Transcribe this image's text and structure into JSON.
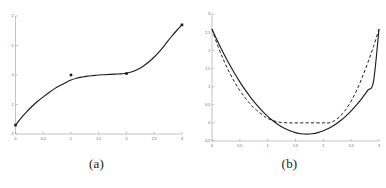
{
  "figure": {
    "background_color": "#ffffff",
    "curve_color": "#1c1c1c",
    "axis_color": "#9b9ca0",
    "tick_label_color": "#55565a"
  },
  "panels": [
    {
      "caption": "(a)",
      "chart_data": {
        "type": "line",
        "title": "",
        "xlabel": "",
        "ylabel": "",
        "xlim": [
          0,
          3
        ],
        "ylim": [
          -2,
          2
        ],
        "grid": false,
        "legend": "none",
        "xticks": [
          0,
          0.5,
          1,
          1.5,
          2,
          2.5,
          3
        ],
        "xtick_labels": [
          "0",
          "0.5",
          "1",
          "1.5",
          "2",
          "2.5",
          "3"
        ],
        "yticks": [
          -2,
          -1,
          0,
          1,
          2
        ],
        "ytick_labels": [
          "-2",
          "-1",
          "0",
          "1",
          "2"
        ],
        "series": [
          {
            "name": "cubic-curve",
            "style": "solid",
            "marker": "square",
            "marker_x": [
              0,
              1,
              2,
              3
            ],
            "marker_y": [
              -1.7,
              0.0,
              0.05,
              1.7
            ],
            "x": [
              0,
              0.1,
              0.2,
              0.3,
              0.4,
              0.5,
              0.6,
              0.7,
              0.8,
              0.9,
              1.0,
              1.1,
              1.2,
              1.3,
              1.4,
              1.5,
              1.6,
              1.7,
              1.8,
              1.9,
              2.0,
              2.1,
              2.2,
              2.3,
              2.4,
              2.5,
              2.6,
              2.7,
              2.8,
              2.9,
              3.0
            ],
            "y": [
              -1.7,
              -1.46,
              -1.25,
              -1.06,
              -0.89,
              -0.74,
              -0.6,
              -0.47,
              -0.36,
              -0.26,
              -0.17,
              -0.11,
              -0.07,
              -0.04,
              -0.02,
              0.0,
              0.01,
              0.02,
              0.03,
              0.04,
              0.06,
              0.11,
              0.19,
              0.3,
              0.44,
              0.61,
              0.81,
              1.04,
              1.28,
              1.5,
              1.7
            ]
          }
        ]
      }
    },
    {
      "caption": "(b)",
      "chart_data": {
        "type": "line",
        "title": "",
        "xlabel": "",
        "ylabel": "",
        "xlim": [
          0,
          3
        ],
        "ylim": [
          -0.5,
          3
        ],
        "grid": false,
        "legend": "none",
        "xticks": [
          0,
          0.5,
          1,
          1.5,
          2,
          2.5,
          3
        ],
        "xtick_labels": [
          "0",
          "0.5",
          "1",
          "1.5",
          "2",
          "2.5",
          "3"
        ],
        "yticks": [
          -0.5,
          0,
          0.5,
          1,
          1.5,
          2,
          2.5,
          3
        ],
        "ytick_labels": [
          "-0.5",
          "0",
          "0.5",
          "1",
          "1.5",
          "2",
          "2.5",
          "3"
        ],
        "series": [
          {
            "name": "parabola-solid",
            "style": "solid",
            "marker": "none",
            "x": [
              0,
              0.1,
              0.2,
              0.3,
              0.4,
              0.5,
              0.6,
              0.7,
              0.8,
              0.9,
              1.0,
              1.1,
              1.2,
              1.3,
              1.4,
              1.5,
              1.6,
              1.7,
              1.8,
              1.9,
              2.0,
              2.1,
              2.2,
              2.3,
              2.4,
              2.5,
              2.6,
              2.7,
              2.8,
              2.9,
              3.0
            ],
            "y": [
              2.58,
              2.25,
              1.94,
              1.65,
              1.38,
              1.13,
              0.9,
              0.69,
              0.5,
              0.33,
              0.18,
              0.05,
              -0.06,
              -0.15,
              -0.22,
              -0.27,
              -0.3,
              -0.31,
              -0.3,
              -0.27,
              -0.22,
              -0.15,
              -0.06,
              0.05,
              0.18,
              0.33,
              0.5,
              0.69,
              0.9,
              1.13,
              2.58
            ]
          },
          {
            "name": "clamped-dashed",
            "style": "dashed",
            "marker": "none",
            "x": [
              0,
              0.1,
              0.2,
              0.3,
              0.4,
              0.5,
              0.6,
              0.7,
              0.8,
              0.9,
              1.0,
              1.2,
              1.4,
              1.6,
              1.8,
              2.0,
              2.1,
              2.2,
              2.3,
              2.4,
              2.5,
              2.6,
              2.7,
              2.8,
              2.9,
              3.0
            ],
            "y": [
              2.58,
              2.14,
              1.76,
              1.43,
              1.14,
              0.89,
              0.68,
              0.5,
              0.35,
              0.23,
              0.12,
              0.02,
              0.0,
              0.0,
              0.0,
              0.0,
              0.0,
              0.06,
              0.18,
              0.36,
              0.6,
              0.9,
              1.26,
              1.66,
              2.1,
              2.58
            ]
          }
        ]
      }
    }
  ]
}
